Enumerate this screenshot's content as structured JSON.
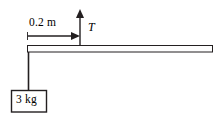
{
  "figure": {
    "background_color": "#ffffff",
    "stroke_color": "#231f20",
    "beam_fill": "#fdfdfd"
  },
  "labels": {
    "distance": "0.2 m",
    "tension": "T",
    "mass": "3 kg"
  },
  "icons": {
    "dimension_arrow": "arrow-right-icon",
    "tension_arrow": "arrow-up-icon",
    "beam": "horizontal-bar-icon",
    "string": "vertical-line-icon",
    "block": "square-block-icon"
  },
  "geometry": {
    "beam": {
      "x": 27,
      "y": 45,
      "width": 186,
      "height": 7
    },
    "dimension_line": {
      "x1": 27,
      "y1": 36,
      "x2": 80,
      "y2": 36
    },
    "tension_arrow": {
      "x": 80,
      "y_base": 45,
      "y_tip": 10
    },
    "string": {
      "x": 28,
      "y1": 52,
      "y2": 90
    },
    "block": {
      "x": 11,
      "y": 90,
      "width": 36,
      "height": 22
    }
  }
}
